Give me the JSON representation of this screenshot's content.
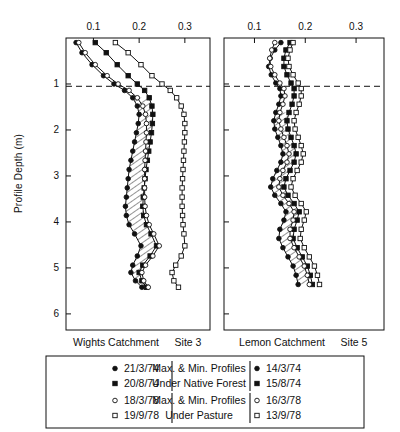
{
  "axes": {
    "y_label": "Profile Depth (m)",
    "y_ticks": [
      "1",
      "2",
      "3",
      "4",
      "5",
      "6"
    ],
    "y_tick_values": [
      1,
      2,
      3,
      4,
      5,
      6
    ],
    "y_range": [
      0,
      6.35
    ],
    "x_ticks": [
      "0.1",
      "0.2",
      "0.3"
    ],
    "x_tick_values": [
      0.1,
      0.2,
      0.3
    ],
    "x_range": [
      0.04,
      0.355
    ],
    "reference_line_depth": 1.05
  },
  "panels": {
    "left": {
      "title_catchment": "Wights Catchment",
      "title_site": "Site 3"
    },
    "right": {
      "title_catchment": "Lemon Catchment",
      "title_site": "Site 5"
    }
  },
  "legend": {
    "group_forest_line1": "Max. & Min. Profiles",
    "group_forest_line2": "Under Native Forest",
    "group_pasture_line1": "Max. & Min. Profiles",
    "group_pasture_line2": "Under Pasture",
    "left_dates": [
      "21/3/74",
      "20/8/74",
      "18/3/78",
      "19/9/78"
    ],
    "right_dates": [
      "14/3/74",
      "15/8/74",
      "16/3/78",
      "13/9/78"
    ],
    "markers": [
      "filled-circle",
      "filled-square",
      "open-circle",
      "open-square"
    ]
  },
  "chart_data": {
    "type": "line",
    "title": "",
    "xlabel": "",
    "ylabel": "Profile Depth (m)",
    "xlim": [
      0.04,
      0.355
    ],
    "ylim": [
      6.35,
      0
    ],
    "grid": false,
    "legend_position": "bottom",
    "orientation": "vertical-depth-profile",
    "panels": [
      {
        "name": "Wights Catchment Site 3",
        "series": [
          {
            "name": "21/3/74",
            "marker": "filled-circle",
            "group": "native-forest-min",
            "x": [
              0.062,
              0.075,
              0.097,
              0.122,
              0.145,
              0.168,
              0.186,
              0.196,
              0.2,
              0.198,
              0.194,
              0.19,
              0.186,
              0.182,
              0.178,
              0.176,
              0.174,
              0.172,
              0.17,
              0.172,
              0.178,
              0.19,
              0.204,
              0.196,
              0.186,
              0.182,
              0.192,
              0.206
            ],
            "y": [
              0.1,
              0.32,
              0.58,
              0.82,
              1.0,
              1.14,
              1.3,
              1.48,
              1.66,
              1.86,
              2.06,
              2.26,
              2.46,
              2.66,
              2.86,
              3.06,
              3.26,
              3.46,
              3.66,
              3.86,
              4.06,
              4.26,
              4.52,
              4.74,
              4.94,
              5.1,
              5.28,
              5.42
            ]
          },
          {
            "name": "20/8/74",
            "marker": "filled-square",
            "group": "native-forest-max",
            "x": [
              0.104,
              0.128,
              0.152,
              0.176,
              0.196,
              0.212,
              0.222,
              0.228,
              0.23,
              0.229,
              0.227,
              0.224,
              0.221,
              0.218,
              0.215,
              0.213,
              0.211,
              0.209,
              0.208,
              0.21,
              0.216,
              0.226,
              0.238,
              0.224,
              0.208,
              0.2,
              0.206,
              0.216
            ],
            "y": [
              0.1,
              0.32,
              0.58,
              0.82,
              1.0,
              1.14,
              1.3,
              1.48,
              1.66,
              1.86,
              2.06,
              2.26,
              2.46,
              2.66,
              2.86,
              3.06,
              3.26,
              3.46,
              3.66,
              3.86,
              4.06,
              4.26,
              4.52,
              4.74,
              4.94,
              5.1,
              5.28,
              5.42
            ]
          },
          {
            "name": "18/3/78",
            "marker": "open-circle",
            "group": "pasture-min",
            "x": [
              0.068,
              0.082,
              0.104,
              0.13,
              0.154,
              0.178,
              0.196,
              0.208,
              0.214,
              0.216,
              0.216,
              0.215,
              0.214,
              0.213,
              0.212,
              0.212,
              0.212,
              0.212,
              0.213,
              0.216,
              0.222,
              0.232,
              0.244,
              0.23,
              0.214,
              0.206,
              0.21,
              0.22
            ],
            "y": [
              0.1,
              0.32,
              0.58,
              0.82,
              1.0,
              1.14,
              1.3,
              1.48,
              1.66,
              1.86,
              2.06,
              2.26,
              2.46,
              2.66,
              2.86,
              3.06,
              3.26,
              3.46,
              3.66,
              3.86,
              4.06,
              4.26,
              4.52,
              4.74,
              4.94,
              5.1,
              5.28,
              5.42
            ]
          },
          {
            "name": "19/9/78",
            "marker": "open-square",
            "group": "pasture-max",
            "x": [
              0.148,
              0.176,
              0.204,
              0.228,
              0.25,
              0.268,
              0.282,
              0.292,
              0.298,
              0.3,
              0.3,
              0.299,
              0.298,
              0.297,
              0.296,
              0.295,
              0.294,
              0.294,
              0.294,
              0.295,
              0.296,
              0.298,
              0.3,
              0.292,
              0.28,
              0.272,
              0.276,
              0.286
            ],
            "y": [
              0.1,
              0.32,
              0.58,
              0.82,
              1.0,
              1.14,
              1.3,
              1.48,
              1.66,
              1.86,
              2.06,
              2.26,
              2.46,
              2.66,
              2.86,
              3.06,
              3.26,
              3.46,
              3.66,
              3.86,
              4.06,
              4.26,
              4.52,
              4.74,
              4.94,
              5.1,
              5.28,
              5.42
            ]
          }
        ],
        "hatched_between": [
          "21/3/74",
          "20/8/74"
        ]
      },
      {
        "name": "Lemon Catchment Site 5",
        "series": [
          {
            "name": "14/3/74",
            "marker": "filled-circle",
            "group": "native-forest-min",
            "x": [
              0.152,
              0.14,
              0.131,
              0.128,
              0.133,
              0.142,
              0.15,
              0.152,
              0.148,
              0.142,
              0.138,
              0.14,
              0.146,
              0.152,
              0.156,
              0.152,
              0.144,
              0.136,
              0.132,
              0.14,
              0.152,
              0.162,
              0.158,
              0.15,
              0.148,
              0.156,
              0.166,
              0.176,
              0.182,
              0.186
            ],
            "y": [
              0.1,
              0.26,
              0.44,
              0.62,
              0.8,
              0.98,
              1.1,
              1.26,
              1.44,
              1.62,
              1.8,
              1.98,
              2.16,
              2.34,
              2.52,
              2.7,
              2.88,
              3.06,
              3.24,
              3.42,
              3.6,
              3.78,
              3.96,
              4.16,
              4.36,
              4.56,
              4.76,
              4.96,
              5.16,
              5.36
            ]
          },
          {
            "name": "15/8/74",
            "marker": "filled-square",
            "group": "native-forest-max",
            "x": [
              0.17,
              0.162,
              0.158,
              0.158,
              0.164,
              0.172,
              0.178,
              0.178,
              0.174,
              0.168,
              0.164,
              0.166,
              0.172,
              0.178,
              0.182,
              0.178,
              0.17,
              0.162,
              0.158,
              0.166,
              0.178,
              0.188,
              0.184,
              0.178,
              0.176,
              0.184,
              0.194,
              0.204,
              0.21,
              0.214
            ],
            "y": [
              0.1,
              0.26,
              0.44,
              0.62,
              0.8,
              0.98,
              1.1,
              1.26,
              1.44,
              1.62,
              1.8,
              1.98,
              2.16,
              2.34,
              2.52,
              2.7,
              2.88,
              3.06,
              3.24,
              3.42,
              3.6,
              3.78,
              3.96,
              4.16,
              4.36,
              4.56,
              4.76,
              4.96,
              5.16,
              5.36
            ]
          },
          {
            "name": "16/3/78",
            "marker": "open-circle",
            "group": "pasture-min",
            "x": [
              0.14,
              0.134,
              0.13,
              0.132,
              0.14,
              0.15,
              0.158,
              0.16,
              0.156,
              0.15,
              0.148,
              0.152,
              0.158,
              0.164,
              0.168,
              0.164,
              0.156,
              0.15,
              0.148,
              0.156,
              0.168,
              0.178,
              0.176,
              0.17,
              0.17,
              0.178,
              0.188,
              0.198,
              0.204,
              0.208
            ],
            "y": [
              0.1,
              0.26,
              0.44,
              0.62,
              0.8,
              0.98,
              1.1,
              1.26,
              1.44,
              1.62,
              1.8,
              1.98,
              2.16,
              2.34,
              2.52,
              2.7,
              2.88,
              3.06,
              3.24,
              3.42,
              3.6,
              3.78,
              3.96,
              4.16,
              4.36,
              4.56,
              4.76,
              4.96,
              5.16,
              5.36
            ]
          },
          {
            "name": "13/9/78",
            "marker": "open-square",
            "group": "pasture-max",
            "x": [
              0.176,
              0.17,
              0.166,
              0.168,
              0.176,
              0.186,
              0.192,
              0.192,
              0.188,
              0.182,
              0.178,
              0.18,
              0.186,
              0.192,
              0.196,
              0.192,
              0.184,
              0.176,
              0.172,
              0.18,
              0.192,
              0.202,
              0.198,
              0.192,
              0.19,
              0.198,
              0.208,
              0.218,
              0.224,
              0.228
            ],
            "y": [
              0.1,
              0.26,
              0.44,
              0.62,
              0.8,
              0.98,
              1.1,
              1.26,
              1.44,
              1.62,
              1.8,
              1.98,
              2.16,
              2.34,
              2.52,
              2.7,
              2.88,
              3.06,
              3.24,
              3.42,
              3.6,
              3.78,
              3.96,
              4.16,
              4.36,
              4.56,
              4.76,
              4.96,
              5.16,
              5.36
            ]
          }
        ],
        "hatched_between": [
          "14/3/74",
          "15/8/74"
        ]
      }
    ]
  }
}
